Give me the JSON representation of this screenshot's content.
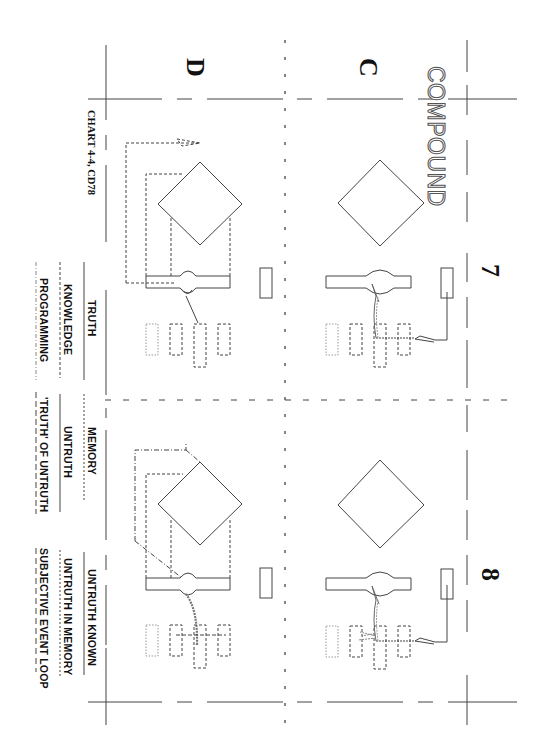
{
  "document": {
    "title": "COMPOUND",
    "caption": "CHART 4-4, CD78",
    "orientation": "rotated 90deg clockwise"
  },
  "panels": {
    "row_labels": [
      "C",
      "D"
    ],
    "column_numbers": [
      "7",
      "8"
    ]
  },
  "legend": {
    "column_7": [
      {
        "label": "TRUTH",
        "line_style": "solid"
      },
      {
        "label": "KNOWLEDGE",
        "line_style": "dashed"
      },
      {
        "label": "PROGRAMMING",
        "line_style": "dash-dot"
      }
    ],
    "column_8_memory": [
      {
        "label": "MEMORY",
        "line_style": "dotted"
      },
      {
        "label": "UNTRUTH",
        "line_style": "solid"
      },
      {
        "label": "'TRUTH' OF UNTRUTH",
        "line_style": "long-dash"
      }
    ],
    "column_8_known": [
      {
        "label": "UNTRUTH KNOWN",
        "line_style": "solid"
      },
      {
        "label": "UNTRUTH IN MEMORY",
        "line_style": "dotted"
      },
      {
        "label": "SUBJECTIVE EVENT LOOP",
        "line_style": "long-dash"
      }
    ]
  },
  "diagram_elements": {
    "per_panel": [
      "diamond",
      "bar-with-bulge",
      "small-rectangle",
      "four-dashed-slots"
    ],
    "panel_count": 4
  },
  "colors": {
    "ink": "#333333",
    "grey_ink": "#777777",
    "background": "#ffffff"
  }
}
